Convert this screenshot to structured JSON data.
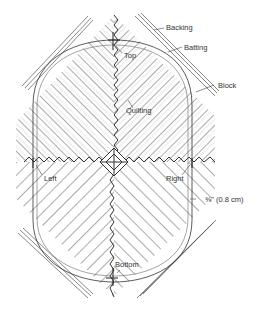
{
  "diagram": {
    "labels": {
      "backing": "Backing",
      "batting": "Batting",
      "block": "Block",
      "top": "Top",
      "quilting": "Quilting",
      "left": "Left",
      "right": "Right",
      "seam": "⅜\" (0.8 cm)",
      "bottom": "Bottom"
    },
    "colors": {
      "line": "#333333",
      "hatch": "#888888",
      "background": "#ffffff"
    }
  }
}
